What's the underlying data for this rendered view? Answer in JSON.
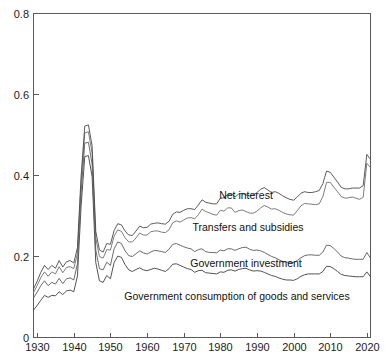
{
  "chart_data": {
    "type": "line",
    "title": "",
    "subtitle": "",
    "xlabel": "",
    "ylabel": "",
    "xlim": [
      1929,
      2021
    ],
    "ylim": [
      0,
      0.8
    ],
    "grid": false,
    "legend_position": "inline-annotations",
    "xticks": [
      "1930",
      "1940",
      "1950",
      "1960",
      "1970",
      "1980",
      "1990",
      "2000",
      "2010",
      "2020"
    ],
    "xtick_values": [
      1930,
      1940,
      1950,
      1960,
      1970,
      1980,
      1990,
      2000,
      2010,
      2020
    ],
    "yticks": [
      "0",
      "0.2",
      "0.4",
      "0.6",
      "0.8"
    ],
    "ytick_values": [
      0,
      0.2,
      0.4,
      0.6,
      0.8
    ],
    "note": "Cumulative stacked lines: each line is the running total of the components below it, as a share of GDP.",
    "x": [
      1929,
      1930,
      1931,
      1932,
      1933,
      1934,
      1935,
      1936,
      1937,
      1938,
      1939,
      1940,
      1941,
      1942,
      1943,
      1944,
      1945,
      1946,
      1947,
      1948,
      1949,
      1950,
      1951,
      1952,
      1953,
      1954,
      1955,
      1956,
      1957,
      1958,
      1959,
      1960,
      1961,
      1962,
      1963,
      1964,
      1965,
      1966,
      1967,
      1968,
      1969,
      1970,
      1971,
      1972,
      1973,
      1974,
      1975,
      1976,
      1977,
      1978,
      1979,
      1980,
      1981,
      1982,
      1983,
      1984,
      1985,
      1986,
      1987,
      1988,
      1989,
      1990,
      1991,
      1992,
      1993,
      1994,
      1995,
      1996,
      1997,
      1998,
      1999,
      2000,
      2001,
      2002,
      2003,
      2004,
      2005,
      2006,
      2007,
      2008,
      2009,
      2010,
      2011,
      2012,
      2013,
      2014,
      2015,
      2016,
      2017,
      2018,
      2019,
      2020,
      2021
    ],
    "series": [
      {
        "name": "Government consumption of goods and services",
        "label": "Government consumption of goods and services",
        "color": "#3f3f3f",
        "cumulative_values": [
          0.068,
          0.079,
          0.092,
          0.104,
          0.099,
          0.104,
          0.103,
          0.113,
          0.106,
          0.115,
          0.117,
          0.113,
          0.152,
          0.325,
          0.447,
          0.449,
          0.397,
          0.185,
          0.14,
          0.136,
          0.153,
          0.145,
          0.185,
          0.201,
          0.198,
          0.18,
          0.167,
          0.163,
          0.168,
          0.172,
          0.167,
          0.165,
          0.168,
          0.171,
          0.169,
          0.166,
          0.163,
          0.17,
          0.181,
          0.182,
          0.178,
          0.174,
          0.17,
          0.168,
          0.161,
          0.165,
          0.166,
          0.16,
          0.159,
          0.158,
          0.157,
          0.162,
          0.161,
          0.166,
          0.167,
          0.164,
          0.168,
          0.17,
          0.171,
          0.167,
          0.164,
          0.165,
          0.164,
          0.161,
          0.157,
          0.153,
          0.151,
          0.147,
          0.144,
          0.142,
          0.142,
          0.141,
          0.145,
          0.151,
          0.155,
          0.157,
          0.157,
          0.157,
          0.157,
          0.163,
          0.176,
          0.175,
          0.17,
          0.163,
          0.156,
          0.153,
          0.152,
          0.151,
          0.15,
          0.15,
          0.15,
          0.162,
          0.15
        ]
      },
      {
        "name": "Government investment",
        "label": "Government investment",
        "color": "#5a5a5a",
        "cumulative_values": [
          0.098,
          0.112,
          0.128,
          0.14,
          0.128,
          0.136,
          0.132,
          0.146,
          0.133,
          0.145,
          0.147,
          0.142,
          0.182,
          0.358,
          0.48,
          0.482,
          0.428,
          0.216,
          0.17,
          0.167,
          0.186,
          0.178,
          0.219,
          0.236,
          0.232,
          0.214,
          0.202,
          0.2,
          0.207,
          0.214,
          0.209,
          0.206,
          0.211,
          0.215,
          0.214,
          0.212,
          0.21,
          0.218,
          0.23,
          0.232,
          0.228,
          0.224,
          0.221,
          0.219,
          0.212,
          0.217,
          0.219,
          0.212,
          0.21,
          0.21,
          0.209,
          0.216,
          0.214,
          0.219,
          0.219,
          0.215,
          0.219,
          0.222,
          0.223,
          0.218,
          0.215,
          0.216,
          0.214,
          0.21,
          0.205,
          0.2,
          0.197,
          0.192,
          0.188,
          0.186,
          0.186,
          0.185,
          0.19,
          0.197,
          0.202,
          0.204,
          0.204,
          0.203,
          0.203,
          0.211,
          0.228,
          0.227,
          0.22,
          0.211,
          0.201,
          0.197,
          0.196,
          0.194,
          0.193,
          0.193,
          0.193,
          0.21,
          0.196
        ]
      },
      {
        "name": "Transfers and subsidies",
        "label": "Transfers and subsidies",
        "color": "#6e6e6e",
        "cumulative_values": [
          0.111,
          0.128,
          0.148,
          0.162,
          0.151,
          0.162,
          0.157,
          0.175,
          0.16,
          0.173,
          0.175,
          0.17,
          0.208,
          0.383,
          0.505,
          0.508,
          0.455,
          0.246,
          0.2,
          0.196,
          0.217,
          0.216,
          0.25,
          0.266,
          0.262,
          0.246,
          0.236,
          0.236,
          0.246,
          0.258,
          0.253,
          0.253,
          0.261,
          0.263,
          0.263,
          0.26,
          0.259,
          0.266,
          0.283,
          0.288,
          0.285,
          0.29,
          0.295,
          0.296,
          0.293,
          0.303,
          0.317,
          0.311,
          0.308,
          0.304,
          0.302,
          0.314,
          0.312,
          0.32,
          0.32,
          0.309,
          0.313,
          0.315,
          0.311,
          0.307,
          0.307,
          0.312,
          0.32,
          0.326,
          0.322,
          0.317,
          0.318,
          0.314,
          0.309,
          0.305,
          0.303,
          0.302,
          0.313,
          0.325,
          0.331,
          0.33,
          0.329,
          0.328,
          0.33,
          0.348,
          0.383,
          0.383,
          0.371,
          0.36,
          0.348,
          0.344,
          0.345,
          0.347,
          0.344,
          0.341,
          0.346,
          0.43,
          0.42
        ]
      },
      {
        "name": "Net interest",
        "label": "Net interest",
        "color": "#4a4a4a",
        "cumulative_values": [
          0.12,
          0.139,
          0.161,
          0.178,
          0.168,
          0.178,
          0.171,
          0.19,
          0.174,
          0.187,
          0.19,
          0.184,
          0.222,
          0.399,
          0.522,
          0.525,
          0.473,
          0.262,
          0.216,
          0.211,
          0.232,
          0.23,
          0.264,
          0.281,
          0.278,
          0.263,
          0.253,
          0.252,
          0.263,
          0.275,
          0.271,
          0.272,
          0.28,
          0.282,
          0.283,
          0.281,
          0.28,
          0.287,
          0.304,
          0.31,
          0.309,
          0.314,
          0.318,
          0.318,
          0.316,
          0.327,
          0.34,
          0.334,
          0.332,
          0.33,
          0.33,
          0.344,
          0.345,
          0.353,
          0.355,
          0.347,
          0.354,
          0.356,
          0.352,
          0.35,
          0.352,
          0.358,
          0.366,
          0.37,
          0.364,
          0.358,
          0.36,
          0.356,
          0.35,
          0.345,
          0.341,
          0.339,
          0.347,
          0.356,
          0.36,
          0.358,
          0.358,
          0.36,
          0.363,
          0.38,
          0.411,
          0.408,
          0.396,
          0.384,
          0.371,
          0.367,
          0.367,
          0.369,
          0.369,
          0.369,
          0.375,
          0.452,
          0.44
        ]
      }
    ],
    "peak_annotation": {
      "year": 1944,
      "value": 0.71
    }
  },
  "axis": {
    "y_tick_labels": [
      "0.8",
      "0.6",
      "0.4",
      "0.2",
      "0"
    ],
    "x_tick_labels": [
      "1930",
      "1940",
      "1950",
      "1960",
      "1970",
      "1980",
      "1990",
      "2000",
      "2010",
      "2020"
    ]
  },
  "labels": {
    "net_interest": "Net interest",
    "transfers_and_subsidies": "Transfers and subsidies",
    "government_investment": "Government investment",
    "government_consumption": "Government consumption of goods and services"
  },
  "colors": {
    "axis": "#5a5a5a",
    "text": "#1c1c1c",
    "line_top": "#4a4a4a",
    "line_second": "#6e6e6e",
    "line_third": "#5a5a5a",
    "line_bottom": "#3f3f3f",
    "background": "#ffffff"
  }
}
